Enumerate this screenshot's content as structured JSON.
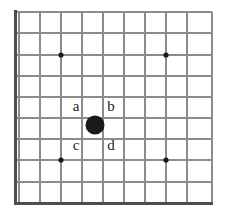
{
  "figure": {
    "type": "go-board-diagram",
    "title": "",
    "background_color": "#ffffff",
    "grid": {
      "line_color": "#8c8c8c",
      "edge_color": "#4d4d4d",
      "line_width": 1.2,
      "edge_width": 3,
      "spacing": 21.4,
      "origin_x": 19,
      "origin_y": 12,
      "columns": 10,
      "rows": 10,
      "left_edge_is_board_border": true,
      "bottom_edge_is_board_border": true
    },
    "star_points": [
      {
        "name": "star-point-top-left",
        "x": 61,
        "y": 55,
        "radius": 2.6,
        "color": "#1a1a1a"
      },
      {
        "name": "star-point-top-right",
        "x": 166,
        "y": 55,
        "radius": 2.6,
        "color": "#1a1a1a"
      },
      {
        "name": "star-point-bottom-left",
        "x": 61,
        "y": 160,
        "radius": 2.6,
        "color": "#1a1a1a"
      },
      {
        "name": "star-point-bottom-right",
        "x": 166,
        "y": 160,
        "radius": 2.6,
        "color": "#1a1a1a"
      }
    ],
    "stones": [
      {
        "name": "black-stone-center",
        "color_name": "black",
        "color": "#1a1a1a",
        "x": 95,
        "y": 125,
        "radius": 9.5
      }
    ],
    "labels": [
      {
        "id": "a",
        "text": "a",
        "x": 76,
        "y": 106,
        "position": "upper-left-of-stone"
      },
      {
        "id": "b",
        "text": "b",
        "x": 111,
        "y": 106,
        "position": "upper-right-of-stone"
      },
      {
        "id": "c",
        "text": "c",
        "x": 76,
        "y": 145,
        "position": "lower-left-of-stone"
      },
      {
        "id": "d",
        "text": "d",
        "x": 111,
        "y": 145,
        "position": "lower-right-of-stone"
      }
    ]
  }
}
